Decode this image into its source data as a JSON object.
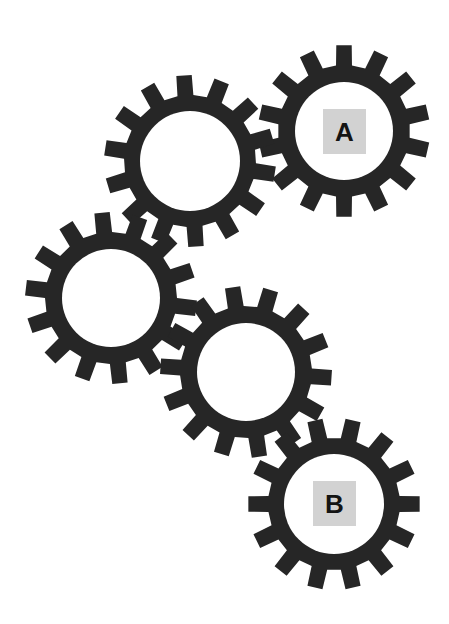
{
  "diagram": {
    "title": "",
    "background": "#ffffff",
    "gear_color": "#262626",
    "label_box_color": "#d2d2d2",
    "label_text_color": "#141414",
    "gears": [
      {
        "id": "gear-a",
        "cx": 344,
        "cy": 131,
        "outer_r": 86,
        "root_r": 66,
        "hole_r": 49,
        "teeth": 14,
        "rotation_deg": 0,
        "label": "A"
      },
      {
        "id": "gear-2",
        "cx": 190,
        "cy": 161,
        "outer_r": 86,
        "root_r": 66,
        "hole_r": 50,
        "teeth": 14,
        "rotation_deg": -4,
        "label": ""
      },
      {
        "id": "gear-3",
        "cx": 111,
        "cy": 298,
        "outer_r": 86,
        "root_r": 66,
        "hole_r": 49,
        "teeth": 14,
        "rotation_deg": -6,
        "label": ""
      },
      {
        "id": "gear-4",
        "cx": 246,
        "cy": 372,
        "outer_r": 86,
        "root_r": 66,
        "hole_r": 49,
        "teeth": 14,
        "rotation_deg": -9,
        "label": ""
      },
      {
        "id": "gear-b",
        "cx": 334,
        "cy": 504,
        "outer_r": 86,
        "root_r": 66,
        "hole_r": 50,
        "teeth": 14,
        "rotation_deg": 12.86,
        "label": "B"
      }
    ],
    "labels": {
      "a": "A",
      "b": "B"
    }
  }
}
